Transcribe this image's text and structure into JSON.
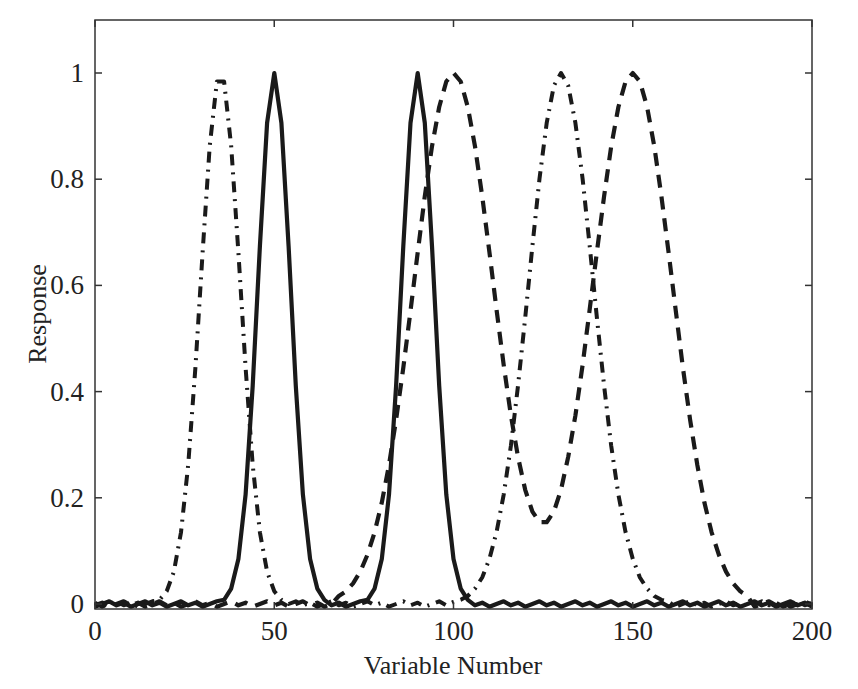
{
  "colors": {
    "line": "#1a1a1a",
    "axis": "#333333",
    "background": "#ffffff"
  },
  "chart_data": {
    "type": "line",
    "title": "",
    "xlabel": "Variable Number",
    "ylabel": "Response",
    "xlim": [
      0,
      200
    ],
    "ylim": [
      0,
      1.1
    ],
    "grid": false,
    "legend": null,
    "x_ticks": [
      0,
      50,
      100,
      150,
      200
    ],
    "x_tick_labels": [
      "0",
      "50",
      "100",
      "150",
      "200"
    ],
    "y_ticks": [
      0,
      0.2,
      0.4,
      0.6,
      0.8,
      1
    ],
    "y_tick_labels": [
      "0",
      "0.2",
      "0.4",
      "0.6",
      "0.8",
      "1"
    ],
    "x": [
      0,
      2,
      4,
      6,
      8,
      10,
      12,
      14,
      16,
      18,
      20,
      22,
      24,
      26,
      28,
      30,
      32,
      34,
      36,
      38,
      40,
      42,
      44,
      46,
      48,
      50,
      52,
      54,
      56,
      58,
      60,
      62,
      64,
      66,
      68,
      70,
      72,
      74,
      76,
      78,
      80,
      82,
      84,
      86,
      88,
      90,
      92,
      94,
      96,
      98,
      100,
      102,
      104,
      106,
      108,
      110,
      112,
      114,
      116,
      118,
      120,
      122,
      124,
      126,
      128,
      130,
      132,
      134,
      136,
      138,
      140,
      142,
      144,
      146,
      148,
      150,
      152,
      154,
      156,
      158,
      160,
      162,
      164,
      166,
      168,
      170,
      172,
      174,
      176,
      178,
      180,
      182,
      184,
      186,
      188,
      190,
      192,
      194,
      196,
      198,
      200
    ],
    "series": [
      {
        "name": "solid",
        "style": "solid",
        "peaks": [
          50,
          90
        ],
        "values": [
          0,
          0,
          0,
          0,
          0,
          0,
          0,
          0,
          0,
          0,
          0,
          0,
          0,
          0,
          0,
          0,
          0,
          0,
          0.008,
          0.029,
          0.085,
          0.206,
          0.411,
          0.674,
          0.906,
          1,
          0.906,
          0.674,
          0.411,
          0.206,
          0.085,
          0.029,
          0.008,
          0,
          0,
          0,
          0,
          0,
          0.008,
          0.029,
          0.085,
          0.206,
          0.411,
          0.674,
          0.906,
          1,
          0.906,
          0.674,
          0.411,
          0.206,
          0.085,
          0.029,
          0.008,
          0,
          0,
          0,
          0,
          0,
          0,
          0,
          0,
          0,
          0,
          0,
          0,
          0,
          0,
          0,
          0,
          0,
          0,
          0,
          0,
          0,
          0,
          0,
          0,
          0,
          0,
          0,
          0,
          0,
          0,
          0,
          0,
          0,
          0,
          0,
          0,
          0,
          0,
          0,
          0,
          0,
          0,
          0,
          0,
          0,
          0,
          0,
          0
        ]
      },
      {
        "name": "dash-dot",
        "style": "dashdot",
        "peaks": [
          35,
          130
        ],
        "values": [
          0,
          0,
          0,
          0,
          0,
          0,
          0,
          0,
          0,
          0.008,
          0.024,
          0.061,
          0.135,
          0.262,
          0.445,
          0.662,
          0.862,
          0.984,
          0.984,
          0.862,
          0.662,
          0.445,
          0.262,
          0.135,
          0.061,
          0.024,
          0.008,
          0,
          0,
          0,
          0,
          0,
          0,
          0,
          0,
          0,
          0,
          0,
          0,
          0,
          0,
          0,
          0,
          0,
          0,
          0,
          0,
          0,
          0,
          0,
          0.004,
          0.008,
          0.015,
          0.029,
          0.05,
          0.085,
          0.135,
          0.206,
          0.298,
          0.411,
          0.539,
          0.674,
          0.801,
          0.906,
          0.976,
          1,
          0.976,
          0.906,
          0.801,
          0.674,
          0.539,
          0.411,
          0.298,
          0.206,
          0.135,
          0.085,
          0.05,
          0.029,
          0.015,
          0.008,
          0.004,
          0,
          0,
          0,
          0,
          0,
          0,
          0,
          0,
          0,
          0,
          0,
          0,
          0,
          0,
          0,
          0,
          0,
          0,
          0,
          0
        ]
      },
      {
        "name": "dashed",
        "style": "dashed",
        "peaks": [
          100,
          150
        ],
        "values": [
          0,
          0,
          0,
          0,
          0,
          0,
          0,
          0,
          0,
          0,
          0,
          0,
          0,
          0,
          0,
          0,
          0,
          0,
          0,
          0,
          0,
          0,
          0,
          0,
          0,
          0,
          0,
          0,
          0,
          0,
          0,
          0,
          0,
          0,
          0.015,
          0.024,
          0.039,
          0.061,
          0.093,
          0.135,
          0.191,
          0.262,
          0.347,
          0.445,
          0.552,
          0.662,
          0.768,
          0.862,
          0.936,
          0.984,
          1,
          0.984,
          0.936,
          0.862,
          0.768,
          0.663,
          0.555,
          0.45,
          0.355,
          0.277,
          0.215,
          0.174,
          0.154,
          0.154,
          0.174,
          0.215,
          0.277,
          0.355,
          0.45,
          0.555,
          0.663,
          0.768,
          0.862,
          0.936,
          0.984,
          1,
          0.984,
          0.936,
          0.862,
          0.768,
          0.662,
          0.552,
          0.445,
          0.347,
          0.262,
          0.191,
          0.135,
          0.093,
          0.061,
          0.039,
          0.024,
          0.015,
          0,
          0,
          0,
          0,
          0,
          0,
          0,
          0,
          0
        ]
      }
    ]
  }
}
